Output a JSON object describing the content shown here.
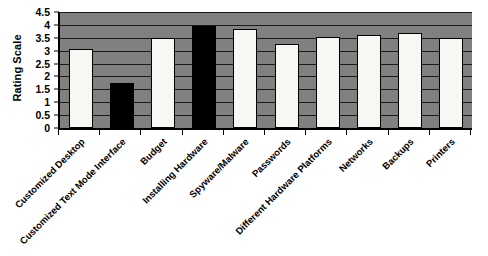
{
  "chart_data": {
    "type": "bar",
    "title": "",
    "xlabel": "",
    "ylabel": "Rating Scale",
    "ylim": [
      0,
      4.5
    ],
    "yticks": [
      "0",
      "0.5",
      "1",
      "1.5",
      "2",
      "2.5",
      "3",
      "3.5",
      "4",
      "4.5"
    ],
    "ytick_values": [
      0,
      0.5,
      1,
      1.5,
      2,
      2.5,
      3,
      3.5,
      4,
      4.5
    ],
    "grid": true,
    "legend": "none",
    "plot_background_color": "#808080",
    "bar_colors": {
      "light": "#f7f7f3",
      "dark": "#000000"
    },
    "categories": [
      "Customized Desktop",
      "Customized Text Mode Interface",
      "Budget",
      "Installing Hardware",
      "Spyware/Malware",
      "Passwords",
      "Different Hardware Platforms",
      "Networks",
      "Backups",
      "Printers"
    ],
    "values": [
      3.05,
      1.75,
      3.5,
      3.95,
      3.85,
      3.25,
      3.55,
      3.6,
      3.7,
      3.5
    ],
    "bar_styles": [
      "light",
      "dark",
      "light",
      "dark",
      "light",
      "light",
      "light",
      "light",
      "light",
      "light"
    ]
  }
}
